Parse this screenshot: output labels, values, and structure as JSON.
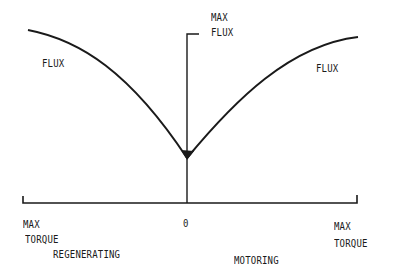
{
  "diagram": {
    "type": "flux-vs-torque",
    "colors": {
      "line": "#1a1a1a",
      "background": "#ffffff"
    },
    "labels": {
      "flux_left": "FLUX",
      "flux_right": "FLUX",
      "max_flux_line1": "MAX",
      "max_flux_line2": "FLUX",
      "origin": "0",
      "max_torque_left_line1": "MAX",
      "max_torque_left_line2": "TORQUE",
      "max_torque_right_line1": "MAX",
      "max_torque_right_line2": "TORQUE",
      "regenerating": "REGENERATING",
      "motoring": "MOTORING"
    },
    "axes": {
      "horizontal": {
        "meaning": "torque",
        "left_end": "MAX TORQUE (regenerating)",
        "center": "0",
        "right_end": "MAX TORQUE (motoring)"
      },
      "vertical": {
        "meaning": "flux",
        "top": "MAX FLUX"
      }
    },
    "curve": {
      "description": "V-shaped flux curve, minimum at zero torque, rising toward max flux at both torque extremes",
      "points_px": [
        [
          28,
          30
        ],
        [
          70,
          42
        ],
        [
          110,
          66
        ],
        [
          150,
          104
        ],
        [
          187,
          158
        ],
        [
          225,
          115
        ],
        [
          265,
          78
        ],
        [
          310,
          50
        ],
        [
          358,
          37
        ]
      ]
    }
  }
}
